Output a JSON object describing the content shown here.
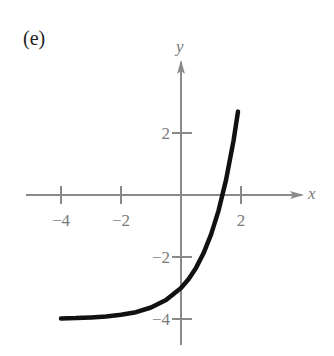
{
  "panel_label": "(e)",
  "colors": {
    "axis": "#8a8a8a",
    "curve": "#111111",
    "text": "#7a7a7a"
  },
  "chart_data": {
    "type": "line",
    "title": "(e)",
    "xlabel": "x",
    "ylabel": "y",
    "xlim": [
      -5,
      4
    ],
    "ylim": [
      -5,
      5
    ],
    "grid": false,
    "x_ticks": [
      -4,
      -2,
      2
    ],
    "x_tick_labels": [
      "−4",
      "−2",
      "2"
    ],
    "y_ticks": [
      2,
      -2,
      -4
    ],
    "y_tick_labels": [
      "2",
      "−2",
      "−4"
    ],
    "series": [
      {
        "name": "curve",
        "x": [
          -4,
          -3.5,
          -3,
          -2.5,
          -2,
          -1.5,
          -1,
          -0.5,
          0,
          0.25,
          0.5,
          0.75,
          1,
          1.25,
          1.5,
          1.75,
          1.9
        ],
        "values": [
          -3.98,
          -3.97,
          -3.95,
          -3.92,
          -3.86,
          -3.78,
          -3.63,
          -3.39,
          -3.0,
          -2.72,
          -2.35,
          -1.88,
          -1.28,
          -0.51,
          0.48,
          1.75,
          2.69
        ]
      }
    ],
    "annotations": []
  }
}
